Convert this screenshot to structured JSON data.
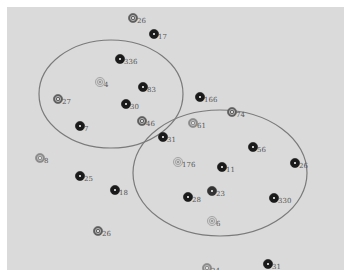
{
  "diagram": {
    "background_color": "#dadada",
    "border_color": "#ffffff",
    "clusters": [
      {
        "id": "cluster-left",
        "cx": 111,
        "cy": 94,
        "rx": 72,
        "ry": 54,
        "stroke": "#7a7a7a"
      },
      {
        "id": "cluster-right",
        "cx": 220,
        "cy": 173,
        "rx": 87,
        "ry": 63,
        "stroke": "#7a7a7a"
      }
    ],
    "nodes": [
      {
        "label": "26",
        "x": 133,
        "y": 18,
        "shade": "mid"
      },
      {
        "label": "17",
        "x": 154,
        "y": 34,
        "shade": "dark"
      },
      {
        "label": "336",
        "x": 120,
        "y": 59,
        "shade": "dark"
      },
      {
        "label": "4",
        "x": 100,
        "y": 82,
        "shade": "light"
      },
      {
        "label": "83",
        "x": 143,
        "y": 87,
        "shade": "dark"
      },
      {
        "label": "27",
        "x": 58,
        "y": 99,
        "shade": "mid"
      },
      {
        "label": "30",
        "x": 126,
        "y": 104,
        "shade": "dark"
      },
      {
        "label": "46",
        "x": 142,
        "y": 121,
        "shade": "mid"
      },
      {
        "label": "7",
        "x": 80,
        "y": 126,
        "shade": "dark"
      },
      {
        "label": "166",
        "x": 200,
        "y": 97,
        "shade": "dark"
      },
      {
        "label": "74",
        "x": 232,
        "y": 112,
        "shade": "mid"
      },
      {
        "label": "61",
        "x": 193,
        "y": 123,
        "shade": "lightmid"
      },
      {
        "label": "31",
        "x": 163,
        "y": 137,
        "shade": "dark"
      },
      {
        "label": "8",
        "x": 40,
        "y": 158,
        "shade": "lightmid"
      },
      {
        "label": "56",
        "x": 253,
        "y": 147,
        "shade": "dark"
      },
      {
        "label": "176",
        "x": 178,
        "y": 162,
        "shade": "light"
      },
      {
        "label": "11",
        "x": 222,
        "y": 167,
        "shade": "dark"
      },
      {
        "label": "26",
        "x": 295,
        "y": 163,
        "shade": "dark"
      },
      {
        "label": "25",
        "x": 80,
        "y": 176,
        "shade": "dark"
      },
      {
        "label": "18",
        "x": 115,
        "y": 190,
        "shade": "dark"
      },
      {
        "label": "28",
        "x": 188,
        "y": 197,
        "shade": "dark"
      },
      {
        "label": "23",
        "x": 212,
        "y": 191,
        "shade": "darkmid"
      },
      {
        "label": "330",
        "x": 274,
        "y": 198,
        "shade": "dark"
      },
      {
        "label": "6",
        "x": 212,
        "y": 221,
        "shade": "light"
      },
      {
        "label": "26",
        "x": 98,
        "y": 231,
        "shade": "mid"
      },
      {
        "label": "24",
        "x": 207,
        "y": 268,
        "shade": "lightmid"
      },
      {
        "label": "31",
        "x": 268,
        "y": 264,
        "shade": "dark"
      }
    ],
    "shade_colors": {
      "dark": "#1a1a1a",
      "darkmid": "#333333",
      "mid": "#5e5e5e",
      "lightmid": "#8a8a8a",
      "light": "#a8a8a8"
    }
  }
}
